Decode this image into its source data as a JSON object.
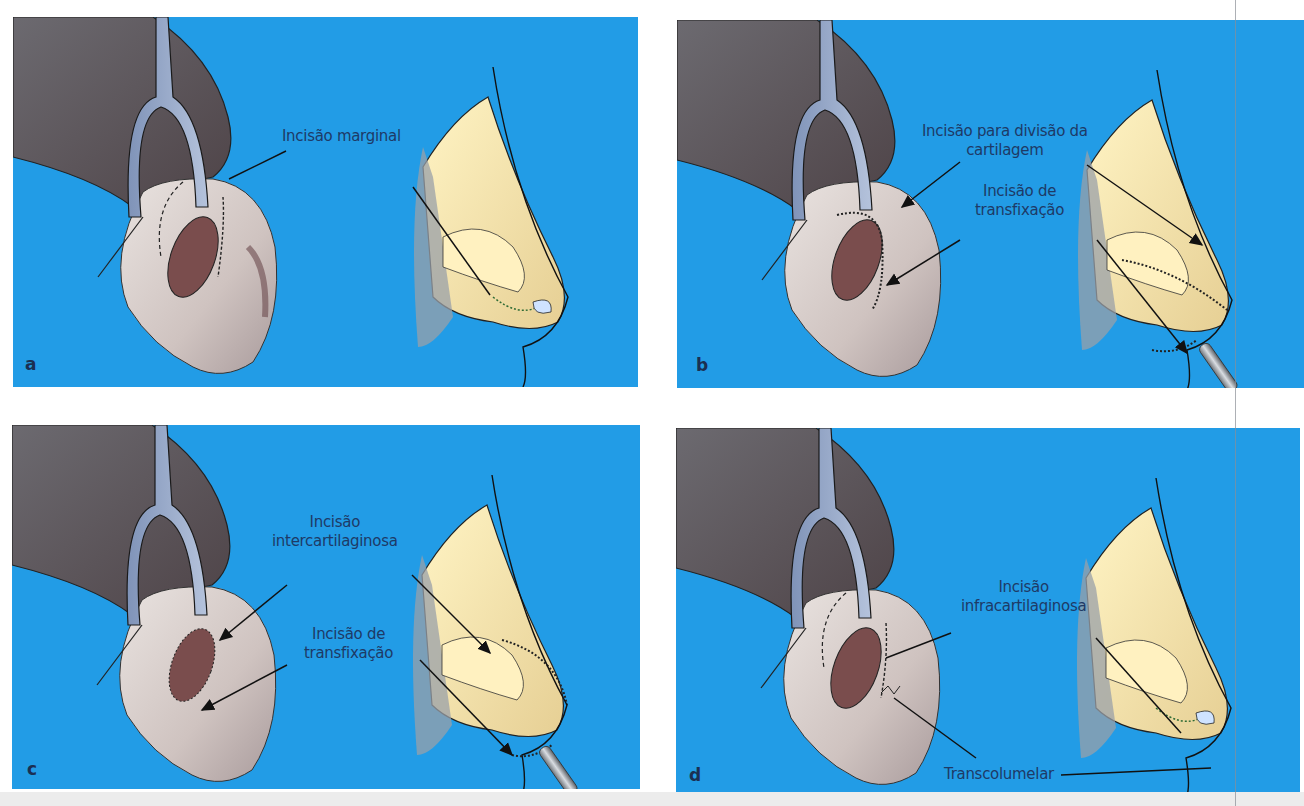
{
  "figure": {
    "background_color": "#229ce6",
    "label_color": "#1e3a66",
    "panels": [
      {
        "letter": "a",
        "labels": [
          {
            "text": "Incisão marginal"
          }
        ]
      },
      {
        "letter": "b",
        "labels": [
          {
            "line1": "Incisão para divisão da",
            "line2": "cartilagem"
          },
          {
            "line1": "Incisão de",
            "line2": "transfixação"
          }
        ]
      },
      {
        "letter": "c",
        "labels": [
          {
            "line1": "Incisão",
            "line2": "intercartilaginosa"
          },
          {
            "line1": "Incisão de",
            "line2": "transfixação"
          }
        ]
      },
      {
        "letter": "d",
        "labels": [
          {
            "line1": "Incisão",
            "line2": "infracartilaginosa"
          },
          {
            "text": "Transcolumelar"
          }
        ]
      }
    ]
  }
}
